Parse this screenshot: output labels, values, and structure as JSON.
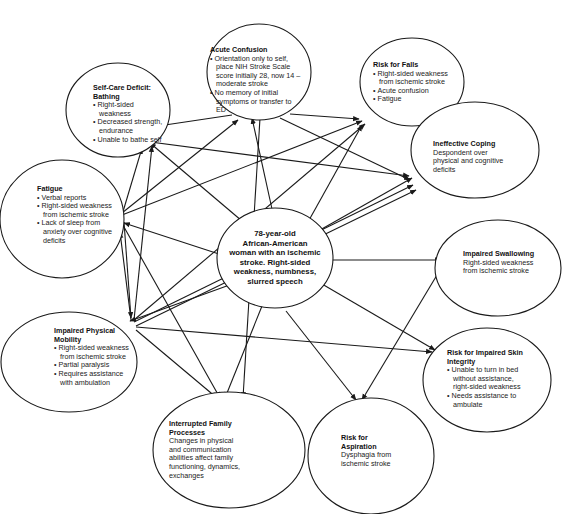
{
  "diagram": {
    "type": "concept-map",
    "center": {
      "text": "78-year-old African-American woman with an ischemic stroke.  Right-sided weakness, numbness, slurred speech",
      "lines": [
        "78-year-old",
        "African-American",
        "woman with an ischemic",
        "stroke.  Right-sided",
        "weakness, numbness,",
        "slurred speech"
      ]
    },
    "nodes": [
      {
        "id": "acute-confusion",
        "title": "Acute Confusion",
        "bullets": [
          "Orientation only to self, place NIH Stroke Scale score initially 28, now 14 –moderate stroke",
          "No memory of initial symptoms or transfer to ED"
        ]
      },
      {
        "id": "risk-for-falls",
        "title": "Risk for Falls",
        "bullets": [
          "Right-sided weakness from ischemic stroke",
          "Acute confusion",
          "Fatigue"
        ]
      },
      {
        "id": "self-care-deficit",
        "title": "Self-Care Deficit: Bathing",
        "bullets": [
          "Right-sided weakness",
          "Decreased strength, endurance",
          "Unable to bathe self"
        ]
      },
      {
        "id": "ineffective-coping",
        "title": "Ineffective Coping",
        "body": "Despondent over physical and cognitive deficits"
      },
      {
        "id": "fatigue",
        "title": "Fatigue",
        "bullets": [
          "Verbal reports",
          "Right-sided weakness from ischemic stroke",
          "Lack of sleep from anxiety over cognitive deficits"
        ]
      },
      {
        "id": "impaired-swallowing",
        "title": "Impaired Swallowing",
        "body": "Right-sided weakness from ischemic stroke"
      },
      {
        "id": "impaired-physical-mobility",
        "title": "Impaired Physical Mobility",
        "bullets": [
          "Right-sided weakness from ischemic stroke",
          "Partial paralysis",
          "Requires assistance with ambulation"
        ]
      },
      {
        "id": "risk-impaired-skin-integrity",
        "title": "Risk for Impaired Skin Integrity",
        "bullets": [
          "Unable to turn in bed without assistance, right-sided weakness",
          "Needs assistance to ambulate"
        ]
      },
      {
        "id": "interrupted-family-processes",
        "title": "Interrupted Family Processes",
        "body": "Changes in physical and communication abilities affect family functioning, dynamics, exchanges"
      },
      {
        "id": "risk-for-aspiration",
        "title": "Risk for Aspiration",
        "body": "Dysphagia from ischemic stroke"
      }
    ],
    "colors": {
      "stroke": "#1a1a1a",
      "background": "#ffffff",
      "text": "#222222"
    }
  }
}
